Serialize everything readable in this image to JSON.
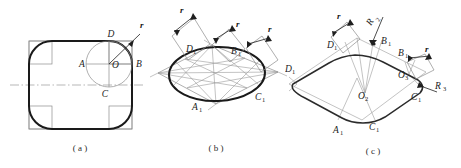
{
  "figure": {
    "title_visible": false,
    "panels": [
      {
        "id": "a",
        "caption": "( a )",
        "labels": [
          {
            "name": "D",
            "text": "D",
            "sub": ""
          },
          {
            "name": "r",
            "text": "r",
            "sub": ""
          },
          {
            "name": "B",
            "text": "B",
            "sub": ""
          },
          {
            "name": "A",
            "text": "A",
            "sub": ""
          },
          {
            "name": "O",
            "text": "O",
            "sub": ""
          },
          {
            "name": "C",
            "text": "C",
            "sub": ""
          }
        ]
      },
      {
        "id": "b",
        "caption": "( b )",
        "labels": [
          {
            "name": "r-left",
            "text": "r",
            "sub": ""
          },
          {
            "name": "r-mid",
            "text": "r",
            "sub": ""
          },
          {
            "name": "r-right",
            "text": "r",
            "sub": ""
          },
          {
            "name": "D1",
            "text": "D",
            "sub": "1"
          },
          {
            "name": "B1",
            "text": "B",
            "sub": "1"
          },
          {
            "name": "A1",
            "text": "A",
            "sub": "1"
          },
          {
            "name": "C1",
            "text": "C",
            "sub": "1"
          }
        ]
      },
      {
        "id": "c",
        "caption": "( c )",
        "labels": [
          {
            "name": "r-top",
            "text": "r",
            "sub": ""
          },
          {
            "name": "R2",
            "text": "R",
            "sub": "2"
          },
          {
            "name": "D1-top",
            "text": "D",
            "sub": "1"
          },
          {
            "name": "B1-top",
            "text": "B",
            "sub": "1"
          },
          {
            "name": "D1-left",
            "text": "D",
            "sub": "1"
          },
          {
            "name": "B1-right",
            "text": "B",
            "sub": "1"
          },
          {
            "name": "r-right",
            "text": "r",
            "sub": ""
          },
          {
            "name": "O3",
            "text": "O",
            "sub": "3"
          },
          {
            "name": "R3",
            "text": "R",
            "sub": "3"
          },
          {
            "name": "C1-right",
            "text": "C",
            "sub": "1"
          },
          {
            "name": "O2",
            "text": "O",
            "sub": "2"
          },
          {
            "name": "A1",
            "text": "A",
            "sub": "1"
          },
          {
            "name": "C1-bot",
            "text": "C",
            "sub": "1"
          }
        ]
      }
    ],
    "colors": {
      "outline_bold": "#1a1a1a",
      "construction_gray": "#8c8c8c",
      "centerline_gray": "#9a9a9a",
      "label_text": "#1b1b1b",
      "background": "#ffffff"
    }
  }
}
